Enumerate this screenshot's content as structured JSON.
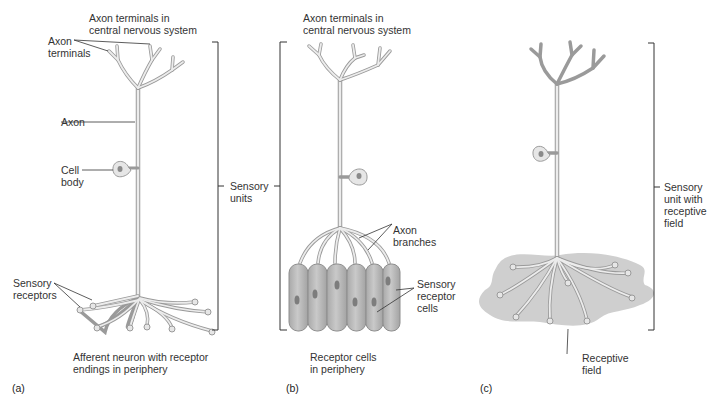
{
  "figure": {
    "panels": [
      {
        "id": "a",
        "letter": "(a)",
        "caption": "Afferent neuron with receptor\nendings in periphery",
        "labels": {
          "axon_terminals_cns": "Axon terminals in\ncentral nervous system",
          "axon_terminals": "Axon\nterminals",
          "axon": "Axon",
          "cell_body": "Cell\nbody",
          "sensory_receptors": "Sensory\nreceptors"
        }
      },
      {
        "id": "b",
        "letter": "(b)",
        "caption": "Receptor cells\nin periphery",
        "labels": {
          "axon_terminals_cns": "Axon terminals in\ncentral nervous system",
          "axon_branches": "Axon\nbranches",
          "sensory_receptor_cells": "Sensory\nreceptor\ncells"
        }
      },
      {
        "id": "c",
        "letter": "(c)",
        "caption": "",
        "labels": {
          "sensory_unit_receptive_field": "Sensory\nunit with\nreceptive\nfield",
          "receptive_field": "Receptive\nfield"
        }
      }
    ],
    "shared_labels": {
      "sensory_units": "Sensory\nunits"
    },
    "colors": {
      "neuron_fill": "#e6e6e6",
      "neuron_stroke": "#9a9a9a",
      "receptor_cell_fill": "#b8b8b8",
      "nucleus_fill": "#7d7d7d",
      "receptive_field_fill": "#cfcfcf",
      "leader_line": "#333333"
    }
  }
}
